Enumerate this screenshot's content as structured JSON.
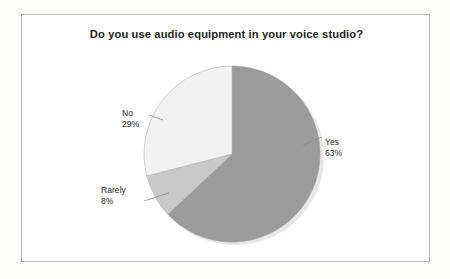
{
  "chart_data": {
    "type": "pie",
    "title": "Do you use audio equipment in your voice studio?",
    "categories": [
      "Yes",
      "Rarely",
      "No"
    ],
    "values": [
      63,
      8,
      29
    ],
    "unit": "%",
    "labels": [
      {
        "name": "Yes",
        "value": "63%",
        "color": "#9b9b9b"
      },
      {
        "name": "Rarely",
        "value": "8%",
        "color": "#c9c9c9"
      },
      {
        "name": "No",
        "value": "29%",
        "color": "#f1f1f1"
      }
    ],
    "legend": "none",
    "data_labels_position": "outside-with-leader-lines",
    "start_angle_deg": 0,
    "direction": "clockwise",
    "grid": false
  },
  "frame": {
    "border_color": "#b9b9b9",
    "background": "#ffffff"
  },
  "slices": {
    "yes": {
      "label": "Yes",
      "percent": "63%",
      "color": "#9b9b9b"
    },
    "rarely": {
      "label": "Rarely",
      "percent": "8%",
      "color": "#c9c9c9"
    },
    "no": {
      "label": "No",
      "percent": "29%",
      "color": "#f1f1f1"
    }
  },
  "colors": {
    "title_text": "#231f20",
    "label_text": "#2b2b2b",
    "leader_line": "#8a8a8a",
    "slice_outline": "#9f9f9f",
    "page_background": "#fdfdfc"
  }
}
